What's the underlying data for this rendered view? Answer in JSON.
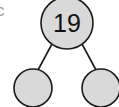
{
  "diagram": {
    "type": "number-bond",
    "part_label": "c",
    "whole": {
      "value": "19"
    },
    "parts": [
      {
        "value": ""
      },
      {
        "value": ""
      }
    ],
    "colors": {
      "circle_fill": "#d9d9d9",
      "stroke": "#1a1a1a",
      "label": "#a0a0a0"
    }
  }
}
